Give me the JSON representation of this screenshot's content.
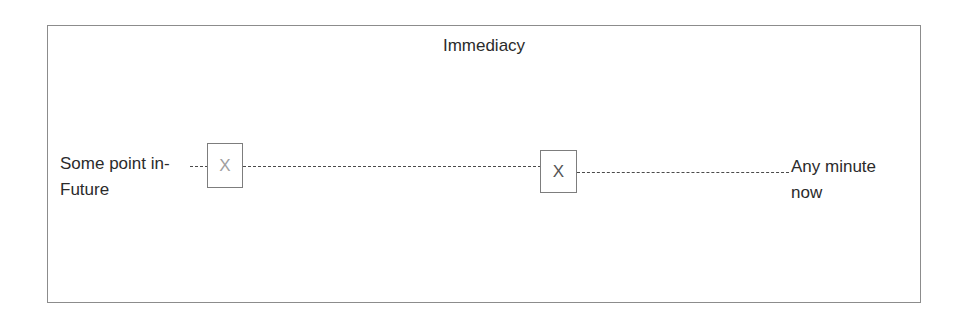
{
  "chart_data": {
    "type": "scatter",
    "title": "Immediacy",
    "xlabel": "",
    "ylabel": "",
    "axis_style": "dashed-line",
    "grid": false,
    "legend": "none",
    "scale_anchors": {
      "left": "Some point in-Future",
      "right": "Any minute now"
    },
    "x": [
      0.18,
      0.62
    ],
    "series": [
      {
        "name": "Immediacy markers",
        "marker": "X",
        "points": [
          {
            "label": "X",
            "x": 0.18,
            "color": "#a0a0a0"
          },
          {
            "label": "X",
            "x": 0.62,
            "color": "#555555"
          }
        ]
      }
    ]
  },
  "frame": {
    "border_color": "#8c8c8c"
  },
  "title": {
    "text": "Immediacy"
  },
  "labels": {
    "left": {
      "line1": "Some point in-",
      "line2": "Future"
    },
    "right": {
      "line1": "Any minute",
      "line2": "now"
    }
  },
  "markers": {
    "first": {
      "glyph": "X",
      "color": "#a0a0a0"
    },
    "second": {
      "glyph": "X",
      "color": "#555555"
    }
  }
}
